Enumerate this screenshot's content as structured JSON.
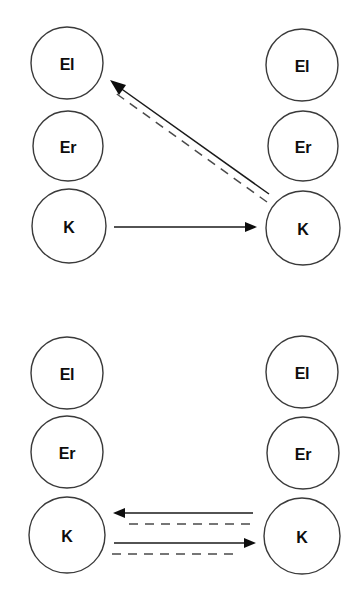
{
  "figure": {
    "type": "diagram",
    "background_color": "#ffffff",
    "stroke_color": "#1a1a1a",
    "node_fill": "#ffffff",
    "node_stroke": "#3a3a3a",
    "dashed_color": "#4a4a4a",
    "label_color": "#0d0d0d"
  },
  "panels": [
    {
      "id": "panel-top",
      "columns": [
        {
          "id": "top-left-column",
          "side": "left",
          "nodes": [
            {
              "id": "top-left-el",
              "label": "El",
              "cx": 67,
              "cy": 63,
              "r": 36
            },
            {
              "id": "top-left-er",
              "label": "Er",
              "cx": 68,
              "cy": 146,
              "r": 35
            },
            {
              "id": "top-left-k",
              "label": "K",
              "cx": 69,
              "cy": 226,
              "r": 37
            }
          ]
        },
        {
          "id": "top-right-column",
          "side": "right",
          "nodes": [
            {
              "id": "top-right-el",
              "label": "El",
              "cx": 302,
              "cy": 65,
              "r": 36
            },
            {
              "id": "top-right-er",
              "label": "Er",
              "cx": 303,
              "cy": 146,
              "r": 35
            },
            {
              "id": "top-right-k",
              "label": "K",
              "cx": 303,
              "cy": 228,
              "r": 37
            }
          ]
        }
      ],
      "edges": [
        {
          "id": "top-edge-k-to-el-solid",
          "style": "solid",
          "from": "top-right-k",
          "to": "top-left-el",
          "direction": "right-to-left",
          "arrow": "end",
          "x1": 269,
          "y1": 194,
          "x2": 112,
          "y2": 82
        },
        {
          "id": "top-edge-k-to-el-dashed",
          "style": "dashed",
          "from": "top-right-k",
          "to": "top-left-el",
          "direction": "right-to-left",
          "arrow": "none",
          "x1": 268,
          "y1": 201,
          "x2": 113,
          "y2": 89
        },
        {
          "id": "top-edge-k-to-k-solid",
          "style": "solid",
          "from": "top-left-k",
          "to": "top-right-k",
          "direction": "left-to-right",
          "arrow": "end",
          "x1": 114,
          "y1": 227,
          "x2": 256,
          "y2": 227
        }
      ]
    },
    {
      "id": "panel-bottom",
      "columns": [
        {
          "id": "bottom-left-column",
          "side": "left",
          "nodes": [
            {
              "id": "bottom-left-el",
              "label": "El",
              "cx": 67,
              "cy": 373,
              "r": 36
            },
            {
              "id": "bottom-left-er",
              "label": "Er",
              "cx": 67,
              "cy": 452,
              "r": 36
            },
            {
              "id": "bottom-left-k",
              "label": "K",
              "cx": 67,
              "cy": 535,
              "r": 38
            }
          ]
        },
        {
          "id": "bottom-right-column",
          "side": "right",
          "nodes": [
            {
              "id": "bottom-right-el",
              "label": "El",
              "cx": 302,
              "cy": 372,
              "r": 36
            },
            {
              "id": "bottom-right-er",
              "label": "Er",
              "cx": 303,
              "cy": 453,
              "r": 36
            },
            {
              "id": "bottom-right-k",
              "label": "K",
              "cx": 302,
              "cy": 536,
              "r": 38
            }
          ]
        }
      ],
      "edges": [
        {
          "id": "bottom-edge-right-to-left-solid",
          "style": "solid",
          "from": "bottom-right-k",
          "to": "bottom-left-k",
          "direction": "right-to-left",
          "arrow": "end",
          "x1": 253,
          "y1": 513,
          "x2": 114,
          "y2": 513
        },
        {
          "id": "bottom-edge-right-to-left-dashed",
          "style": "dashed",
          "from": "bottom-right-k",
          "to": "bottom-left-k",
          "direction": "right-to-left",
          "arrow": "none",
          "x1": 250,
          "y1": 524,
          "x2": 128,
          "y2": 524
        },
        {
          "id": "bottom-edge-left-to-right-solid",
          "style": "solid",
          "from": "bottom-left-k",
          "to": "bottom-right-k",
          "direction": "left-to-right",
          "arrow": "end",
          "x1": 114,
          "y1": 543,
          "x2": 255,
          "y2": 543
        },
        {
          "id": "bottom-edge-left-to-right-dashed",
          "style": "dashed",
          "from": "bottom-left-k",
          "to": "bottom-right-k",
          "direction": "left-to-right",
          "arrow": "none",
          "x1": 112,
          "y1": 554,
          "x2": 240,
          "y2": 554
        }
      ]
    }
  ],
  "labels": {
    "el": "El",
    "er": "Er",
    "k": "K"
  }
}
